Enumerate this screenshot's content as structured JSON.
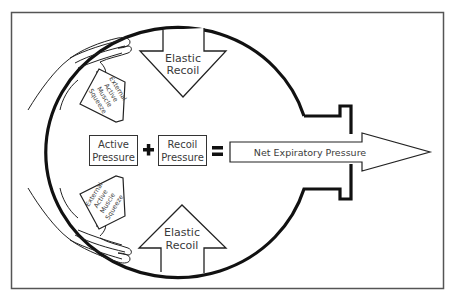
{
  "diagram": {
    "elastic_recoil_top": {
      "line1": "Elastic",
      "line2": "Recoil"
    },
    "elastic_recoil_bottom": {
      "line1": "Elastic",
      "line2": "Recoil"
    },
    "external_squeeze_top": {
      "line1": "External",
      "line2": "Active",
      "line3": "Muscle",
      "line4": "Squeeze"
    },
    "external_squeeze_bottom": {
      "line1": "External",
      "line2": "Active",
      "line3": "Muscle",
      "line4": "Squeeze"
    },
    "equation": {
      "term1": {
        "line1": "Active",
        "line2": "Pressure"
      },
      "plus": "+",
      "term2": {
        "line1": "Recoil",
        "line2": "Pressure"
      },
      "equals": "=",
      "result": "Net Expiratory Pressure"
    }
  }
}
